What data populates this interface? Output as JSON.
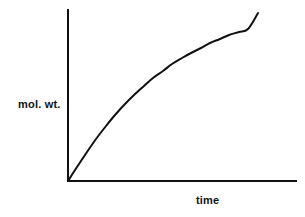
{
  "figure": {
    "background_color": "#ffffff",
    "ink_color": "#111111"
  },
  "chart_data": {
    "type": "line",
    "title": "",
    "subtitle": "",
    "xlabel": "time",
    "ylabel": "mol. wt.",
    "xlabel_position": "below-axis-right",
    "ylabel_position": "left-of-axis-middle",
    "grid": false,
    "legend": null,
    "legend_position": "none",
    "xticks": [],
    "yticks": [],
    "xticklabels": [],
    "yticklabels": [],
    "xlim": [
      0,
      1
    ],
    "ylim": [
      0,
      1
    ],
    "annotations": [],
    "axis_style": {
      "spines": [
        "left",
        "bottom"
      ],
      "line_width_px": 2,
      "color": "#111111",
      "origin_px": [
        68,
        181
      ],
      "y_axis_top_px": [
        68,
        10
      ],
      "x_axis_right_px": [
        296,
        181
      ]
    },
    "series": [
      {
        "name": "molecular weight vs time",
        "shape": "concave-down saturating growth",
        "line_width_px": 2,
        "color": "#111111",
        "x": [
          0.0,
          0.05,
          0.1,
          0.15,
          0.2,
          0.25,
          0.3,
          0.35,
          0.4,
          0.45,
          0.5,
          0.55,
          0.6,
          0.65,
          0.7,
          0.75,
          0.8,
          0.85,
          0.9,
          0.95,
          1.0
        ],
        "y": [
          0.0,
          0.09,
          0.18,
          0.26,
          0.34,
          0.41,
          0.48,
          0.54,
          0.6,
          0.65,
          0.7,
          0.745,
          0.785,
          0.822,
          0.855,
          0.885,
          0.912,
          0.936,
          0.958,
          0.98,
          1.0
        ],
        "points_px": [
          [
            68,
            181
          ],
          [
            77,
            167
          ],
          [
            87,
            152
          ],
          [
            96,
            139
          ],
          [
            106,
            126
          ],
          [
            115,
            115
          ],
          [
            125,
            104
          ],
          [
            134,
            95
          ],
          [
            144,
            86
          ],
          [
            153,
            78
          ],
          [
            163,
            71
          ],
          [
            172,
            64
          ],
          [
            182,
            58
          ],
          [
            191,
            53
          ],
          [
            201,
            48
          ],
          [
            210,
            43
          ],
          [
            220,
            39
          ],
          [
            229,
            35
          ],
          [
            239,
            32
          ],
          [
            248,
            29
          ],
          [
            258,
            13
          ]
        ]
      }
    ]
  }
}
